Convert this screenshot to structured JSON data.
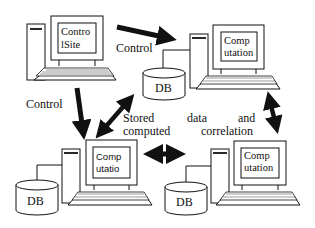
{
  "diagram": {
    "nodes": {
      "control_site": {
        "screen_line1": "Contro",
        "screen_line2": "lSite"
      },
      "top_right": {
        "screen_line1": "Comp",
        "screen_line2": "utation",
        "db_label": "DB"
      },
      "bottom_left": {
        "screen_line1": "Comp",
        "screen_line2": "utatio",
        "db_label": "DB"
      },
      "bottom_right": {
        "screen_line1": "Comp",
        "screen_line2": "utation",
        "db_label": "DB"
      }
    },
    "edges": {
      "control_top": "Control",
      "control_left": "Control"
    },
    "caption": {
      "line1_w1": "Stored",
      "line1_w2": "data",
      "line1_w3": "and",
      "line2_w1": "computed",
      "line2_w2": "correlation"
    },
    "colors": {
      "stroke": "#111111",
      "background": "#ffffff"
    }
  }
}
